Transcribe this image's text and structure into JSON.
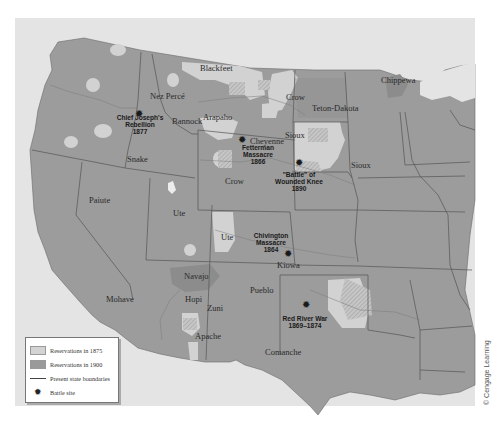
{
  "map": {
    "colors": {
      "ocean": "#e6e6e6",
      "canada_mexico": "#e2e2e2",
      "states": "#9e9e9e",
      "reservation_1875": "#d4d4d4",
      "reservation_1900": "#8e8e8e",
      "boundary": "#555555"
    },
    "tribes": [
      {
        "name": "Blackfeet",
        "x": 200,
        "y": 71
      },
      {
        "name": "Nez Percé",
        "x": 150,
        "y": 99
      },
      {
        "name": "Bannock",
        "x": 172,
        "y": 124
      },
      {
        "name": "Arapaho",
        "x": 203,
        "y": 120
      },
      {
        "name": "Crow",
        "x": 286,
        "y": 100
      },
      {
        "name": "Teton-Dakota",
        "x": 312,
        "y": 111
      },
      {
        "name": "Chippewa",
        "x": 381,
        "y": 83
      },
      {
        "name": "Cheyenne",
        "x": 250,
        "y": 144
      },
      {
        "name": "Sioux",
        "x": 285,
        "y": 138
      },
      {
        "name": "Sioux",
        "x": 351,
        "y": 168
      },
      {
        "name": "Snake",
        "x": 127,
        "y": 162
      },
      {
        "name": "Crow",
        "x": 225,
        "y": 184
      },
      {
        "name": "Paiute",
        "x": 89,
        "y": 203
      },
      {
        "name": "Ute",
        "x": 173,
        "y": 216
      },
      {
        "name": "Ute",
        "x": 221,
        "y": 240
      },
      {
        "name": "Kiowa",
        "x": 277,
        "y": 268
      },
      {
        "name": "Navajo",
        "x": 184,
        "y": 279
      },
      {
        "name": "Hopi",
        "x": 185,
        "y": 302
      },
      {
        "name": "Zuni",
        "x": 207,
        "y": 311
      },
      {
        "name": "Pueblo",
        "x": 250,
        "y": 293
      },
      {
        "name": "Mohave",
        "x": 106,
        "y": 302
      },
      {
        "name": "Apache",
        "x": 195,
        "y": 339
      },
      {
        "name": "Comanche",
        "x": 265,
        "y": 355
      }
    ],
    "battles": [
      {
        "lines": [
          "Chief Joseph's",
          "Rebellion",
          "1877"
        ],
        "x": 139,
        "y": 117,
        "tx": 140,
        "ty": 120
      },
      {
        "lines": [
          "Fetterman",
          "Massacre",
          "1866"
        ],
        "x": 242,
        "y": 143,
        "tx": 258,
        "ty": 150
      },
      {
        "lines": [
          "\"Battle\" of",
          "Wounded Knee",
          "1890"
        ],
        "x": 299,
        "y": 166,
        "tx": 299,
        "ty": 177
      },
      {
        "lines": [
          "Chivington",
          "Massacre",
          "1864"
        ],
        "x": 288,
        "y": 257,
        "tx": 271,
        "ty": 238
      },
      {
        "lines": [
          "Red River War",
          "1869–1874"
        ],
        "x": 306,
        "y": 308,
        "tx": 305,
        "ty": 321
      }
    ]
  },
  "legend": {
    "items": [
      {
        "label": "Reservations in 1875"
      },
      {
        "label": "Reservations in 1900"
      },
      {
        "label": "Present state boundaries"
      },
      {
        "label": "Battle site"
      }
    ]
  },
  "credit": "© Cengage Learning"
}
